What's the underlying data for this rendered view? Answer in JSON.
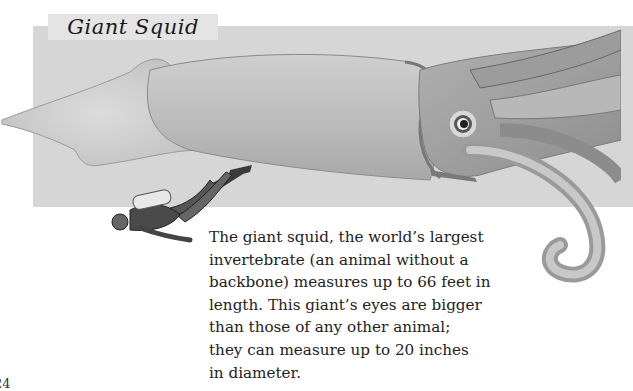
{
  "page": {
    "title": "Giant Squid",
    "page_number": "24",
    "body_lines": [
      "The giant squid, the world’s largest",
      "invertebrate (an animal without a",
      "backbone) measures up to 66 feet in",
      "length. This giant’s eyes are bigger",
      "than those of any other animal;",
      "they can measure up to 20 inches",
      "in diameter."
    ]
  },
  "illustrations": {
    "main": "giant-squid-illustration",
    "secondary": "scuba-diver-illustration"
  },
  "colors": {
    "panel": "#d6d6d6",
    "title_box": "#e4e4e4",
    "text": "#222222"
  }
}
